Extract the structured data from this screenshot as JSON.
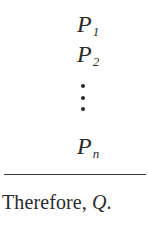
{
  "argument": {
    "premises": [
      {
        "symbol": "P",
        "subscript": "1"
      },
      {
        "symbol": "P",
        "subscript": "2"
      },
      {
        "symbol": "P",
        "subscript": "n"
      }
    ],
    "ellipsis": "vertical-dots",
    "conclusion": {
      "prefix": "Therefore, ",
      "symbol": "Q",
      "suffix": "."
    }
  }
}
